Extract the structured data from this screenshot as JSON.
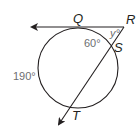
{
  "diagram": {
    "type": "circle-tangent-secant",
    "points": {
      "Q": "Q",
      "R": "R",
      "S": "S",
      "T": "T"
    },
    "angles": {
      "arc_QS": "60°",
      "arc_QT": "190°",
      "angle_R": "y°"
    },
    "colors": {
      "stroke": "#231f20",
      "angle_text": "#6d6e71"
    }
  }
}
